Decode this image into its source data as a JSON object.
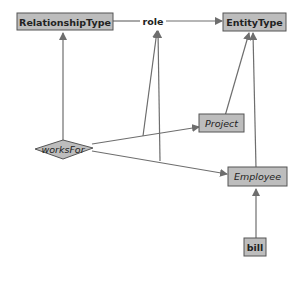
{
  "diagram": {
    "type": "ontology-graph",
    "colors": {
      "node_fill": "#bdbdbd",
      "node_stroke": "#555555",
      "edge": "#6e6e6e",
      "text": "#222222"
    },
    "nodes": {
      "relationship_type": {
        "label": "RelationshipType",
        "style": "bold",
        "shape": "box"
      },
      "role": {
        "label": "role",
        "style": "bold",
        "shape": "text"
      },
      "entity_type": {
        "label": "EntityType",
        "style": "bold",
        "shape": "box"
      },
      "project": {
        "label": "Project",
        "style": "italic",
        "shape": "box"
      },
      "works_for": {
        "label": "worksFor",
        "style": "italic",
        "shape": "diamond"
      },
      "employee": {
        "label": "Employee",
        "style": "italic",
        "shape": "box"
      },
      "bill": {
        "label": "bill",
        "style": "bold",
        "shape": "box"
      }
    },
    "edges": [
      {
        "from": "RelationshipType",
        "to": "role"
      },
      {
        "from": "role",
        "to": "EntityType"
      },
      {
        "from": "worksFor",
        "to": "RelationshipType"
      },
      {
        "from": "worksFor",
        "to": "Project"
      },
      {
        "from": "worksFor",
        "to": "Employee"
      },
      {
        "from": "worksFor-Project edge",
        "to": "role"
      },
      {
        "from": "worksFor-Employee edge",
        "to": "role"
      },
      {
        "from": "Project",
        "to": "EntityType"
      },
      {
        "from": "Employee",
        "to": "EntityType"
      },
      {
        "from": "bill",
        "to": "Employee"
      }
    ]
  }
}
